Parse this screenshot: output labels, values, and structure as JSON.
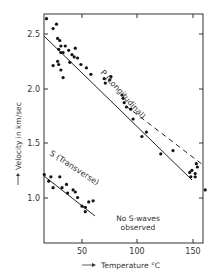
{
  "chart_data": {
    "type": "scatter",
    "title": "",
    "xlabel": "Temperature °C",
    "ylabel": "Velocity in km/sec",
    "xlim": [
      16,
      159
    ],
    "ylim": [
      0.59,
      2.68
    ],
    "x_ticks": [
      50,
      100,
      150
    ],
    "y_ticks": [
      1.0,
      1.5,
      2.0,
      2.5
    ],
    "x_tick_labels": [
      "50",
      "100",
      "150"
    ],
    "y_tick_labels": [
      "1.0",
      "1.5",
      "2.0",
      "2.5"
    ],
    "grid": false,
    "annotations": [
      {
        "text": "P (Longitudinal)",
        "x": 78,
        "y": 1.95,
        "rotation": 48
      },
      {
        "text": "S (Transverse)",
        "x": 30,
        "y": 1.42,
        "rotation": 33
      },
      {
        "text": "No S-waves",
        "x": 115,
        "y": 0.78
      },
      {
        "text": "observed",
        "x": 115,
        "y": 0.7
      }
    ],
    "series": [
      {
        "name": "P (Longitudinal)",
        "marker": "dot",
        "points": [
          [
            18,
            2.64
          ],
          [
            24,
            2.55
          ],
          [
            27,
            2.59
          ],
          [
            28,
            2.46
          ],
          [
            30,
            2.44
          ],
          [
            29,
            2.36
          ],
          [
            31,
            2.39
          ],
          [
            31,
            2.33
          ],
          [
            33,
            2.33
          ],
          [
            24,
            2.21
          ],
          [
            28,
            2.25
          ],
          [
            29,
            2.22
          ],
          [
            31,
            2.17
          ],
          [
            33,
            2.1
          ],
          [
            35,
            2.39
          ],
          [
            38,
            2.35
          ],
          [
            39,
            2.24
          ],
          [
            41,
            2.31
          ],
          [
            43,
            2.29
          ],
          [
            44,
            2.37
          ],
          [
            46,
            2.28
          ],
          [
            49,
            2.22
          ],
          [
            54,
            2.19
          ],
          [
            58,
            2.13
          ],
          [
            70,
            2.09
          ],
          [
            71,
            2.05
          ],
          [
            75,
            2.08
          ],
          [
            76,
            2.11
          ],
          [
            86,
            1.94
          ],
          [
            87,
            1.91
          ],
          [
            88,
            1.87
          ],
          [
            90,
            1.83
          ],
          [
            94,
            1.81
          ],
          [
            96,
            1.72
          ],
          [
            104,
            1.56
          ],
          [
            108,
            1.6
          ],
          [
            121,
            1.4
          ],
          [
            132,
            1.43
          ],
          [
            147,
            1.23
          ],
          [
            148,
            1.19
          ],
          [
            149,
            1.25
          ],
          [
            152,
            1.22
          ],
          [
            153,
            1.31
          ],
          [
            154,
            1.28
          ],
          [
            152,
            1.19
          ],
          [
            161,
            1.07
          ]
        ],
        "fit_line": {
          "style": "solid",
          "from": [
            16,
            2.48
          ],
          "to": [
            150,
            1.16
          ]
        },
        "extrapolation": {
          "style": "dashed",
          "from": [
            90,
            1.86
          ],
          "to": [
            159,
            1.3
          ]
        }
      },
      {
        "name": "S (Transverse)",
        "marker": "dot",
        "points": [
          [
            16,
            1.21
          ],
          [
            20,
            1.15
          ],
          [
            22,
            1.19
          ],
          [
            24,
            1.09
          ],
          [
            30,
            1.19
          ],
          [
            32,
            1.09
          ],
          [
            36,
            1.12
          ],
          [
            37,
            1.04
          ],
          [
            42,
            1.07
          ],
          [
            44,
            1.05
          ],
          [
            46,
            1.0
          ],
          [
            50,
            0.92
          ],
          [
            53,
            0.91
          ],
          [
            53,
            0.87
          ],
          [
            56,
            0.96
          ],
          [
            60,
            0.97
          ]
        ],
        "fit_line": {
          "style": "solid",
          "from": [
            16,
            1.22
          ],
          "to": [
            62,
            0.85
          ]
        }
      }
    ]
  },
  "labels": {
    "ylabel": "Velocity in km/sec",
    "xlabel": "Temperature °C",
    "p_label": "P (Longitudinal)",
    "s_label": "S (Transverse)",
    "note_line1": "No S-waves",
    "note_line2": "observed",
    "yt_25": "2.5",
    "yt_20": "2.0",
    "yt_15": "1.5",
    "yt_10": "1.0",
    "xt_50": "50",
    "xt_100": "100",
    "xt_150": "150"
  },
  "colors": {
    "ink": "#222222",
    "background": "#ffffff"
  }
}
